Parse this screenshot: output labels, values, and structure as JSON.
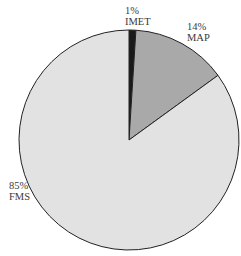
{
  "chart_data": {
    "type": "pie",
    "title": "",
    "slices": [
      {
        "label": "IMET",
        "value": 1,
        "display": "1%",
        "color": "#1a1a1a"
      },
      {
        "label": "MAP",
        "value": 14,
        "display": "14%",
        "color": "#a9a9a9"
      },
      {
        "label": "FMS",
        "value": 85,
        "display": "85%",
        "color": "#e2e2e2"
      }
    ],
    "start_angle_deg": 0,
    "direction": "clockwise",
    "legend": "none",
    "labels_outside": true
  },
  "labels": {
    "imet_pct": "1%",
    "imet_name": "IMET",
    "map_pct": "14%",
    "map_name": "MAP",
    "fms_pct": "85%",
    "fms_name": "FMS"
  }
}
